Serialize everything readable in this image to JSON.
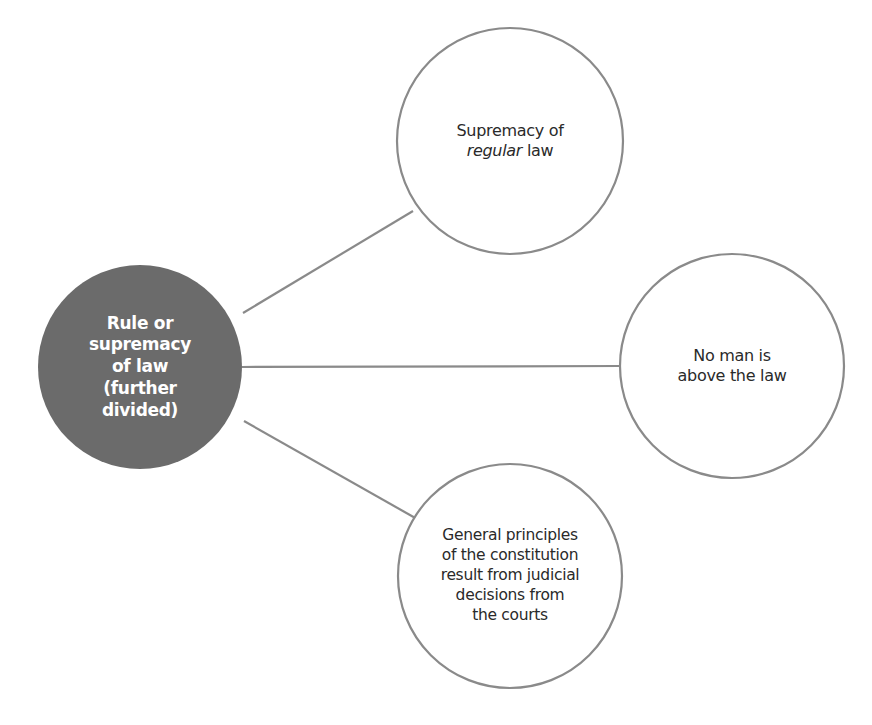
{
  "diagram": {
    "type": "hub-and-spoke concept map",
    "colors": {
      "background": "#ffffff",
      "hub_fill": "#6b6b6b",
      "stroke": "#8a8a8a",
      "hub_text": "#ffffff",
      "leaf_text": "#2a2a2a"
    },
    "hub": {
      "id": "rule-of-law",
      "lines": [
        "Rule or",
        "supremacy",
        "of law",
        "(further",
        "divided)"
      ],
      "cx": 140,
      "cy": 367,
      "r": 102
    },
    "leaves": [
      {
        "id": "supremacy-regular-law",
        "lines": [
          "Supremacy of",
          "regular law"
        ],
        "italic_word": "regular",
        "line2_rest": " law",
        "cx": 510,
        "cy": 141,
        "r": 113
      },
      {
        "id": "no-man-above-law",
        "lines": [
          "No man is",
          "above the law"
        ],
        "cx": 732,
        "cy": 366,
        "r": 112
      },
      {
        "id": "general-principles",
        "lines": [
          "General principles",
          "of the constitution",
          "result from judicial",
          "decisions from",
          "the courts"
        ],
        "cx": 510,
        "cy": 576,
        "r": 112
      }
    ],
    "edges": [
      {
        "from": "rule-of-law",
        "to": "supremacy-regular-law",
        "x1": 243,
        "y1": 313,
        "x2": 413,
        "y2": 211
      },
      {
        "from": "rule-of-law",
        "to": "no-man-above-law",
        "x1": 242,
        "y1": 367,
        "x2": 620,
        "y2": 366
      },
      {
        "from": "rule-of-law",
        "to": "general-principles",
        "x1": 244,
        "y1": 421,
        "x2": 417,
        "y2": 519
      }
    ]
  }
}
